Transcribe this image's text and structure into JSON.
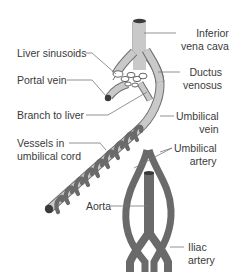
{
  "diagram": {
    "labels": {
      "inferior_vena_cava": [
        "Inferior",
        "vena cava"
      ],
      "liver_sinusoids": "Liver sinusoids",
      "ductus_venosus": [
        "Ductus",
        "venosus"
      ],
      "portal_vein": "Portal vein",
      "branch_to_liver": "Branch to liver",
      "umbilical_vein": [
        "Umbilical",
        "vein"
      ],
      "vessels_in_umbilical_cord": [
        "Vessels in",
        "umbilical cord"
      ],
      "umbilical_artery": [
        "Umbilical",
        "artery"
      ],
      "aorta": "Aorta",
      "iliac_artery": [
        "Iliac",
        "artery"
      ]
    },
    "colors": {
      "vein_fill": "#c9c9c9",
      "vein_outline": "#6e6e6e",
      "artery_fill": "#6a6a6a",
      "vessel_end": "#3a3a3a",
      "leader_line": "#777777",
      "text": "#3a3a3a"
    }
  }
}
